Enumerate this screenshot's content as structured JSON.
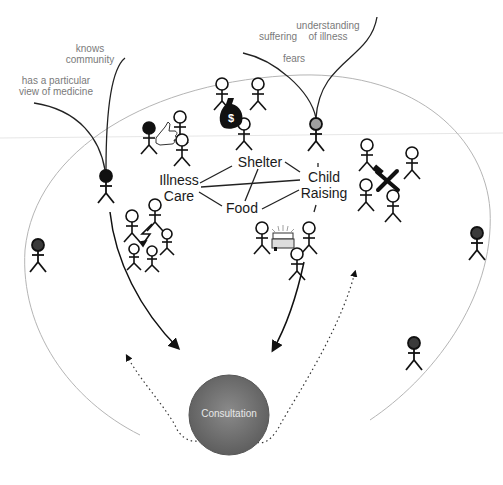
{
  "annotations": {
    "knows_community": "knows\ncommunity",
    "knows_community_l1": "knows",
    "knows_community_l2": "community",
    "view_of_medicine_l1": "has a particular",
    "view_of_medicine_l2": "view of medicine",
    "suffering": "suffering",
    "understanding_l1": "understanding",
    "understanding_l2": "of illness",
    "fears": "fears"
  },
  "nodes": {
    "illness_care_l1": "Illness",
    "illness_care_l2": "Care",
    "shelter": "Shelter",
    "food": "Food",
    "child_raising_l1": "Child",
    "child_raising_l2": "Raising"
  },
  "center": {
    "label": "Consultation"
  },
  "icons": [
    "money-bag-icon",
    "thumbs-up-icon",
    "lightning-bolt-icon",
    "police-car-icon",
    "hammer-wrench-icon"
  ],
  "colors": {
    "doctor_fill": "#111111",
    "patient_fill": "#9a9a9a",
    "outsider_fill": "#3a3a3a",
    "consultation_fill": "#6e6e6e",
    "boundary_stroke": "#b5b5b5",
    "annotation_text": "#7a7a7a"
  }
}
